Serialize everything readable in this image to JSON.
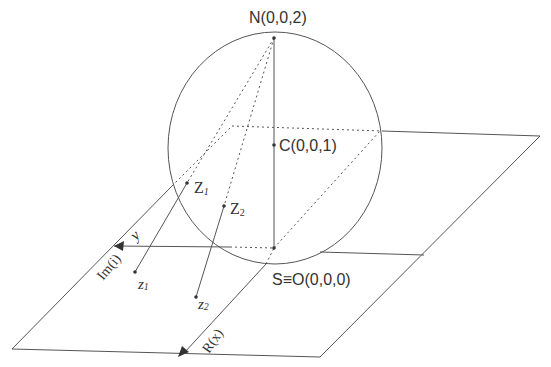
{
  "diagram": {
    "points": {
      "north": "N(0,0,2)",
      "center": "C(0,0,1)",
      "south": "S≡O(0,0,0)",
      "Z1_main": "Z",
      "Z1_sub": "1",
      "Z2_main": "Z",
      "Z2_sub": "2",
      "z1_main": "z",
      "z1_sub": "1",
      "z2_main": "z",
      "z2_sub": "2"
    },
    "axes": {
      "y_label": "y",
      "imag_label": "Im(i)",
      "real_label": "R(x)"
    },
    "colors": {
      "stroke": "#555555",
      "text": "#333333",
      "background": "#ffffff"
    }
  }
}
